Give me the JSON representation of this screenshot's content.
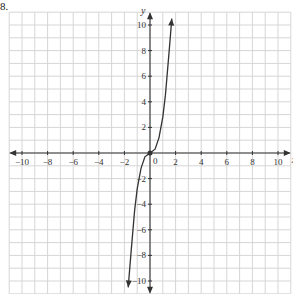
{
  "problem_number": "8.",
  "chart_data": {
    "type": "line",
    "title": "",
    "xlabel": "x",
    "ylabel": "y",
    "xlim": [
      -11,
      11
    ],
    "ylim": [
      -11,
      11
    ],
    "grid": true,
    "x_ticks": [
      -10,
      -8,
      -6,
      -4,
      -2,
      2,
      4,
      6,
      8,
      10
    ],
    "y_ticks": [
      -10,
      -8,
      -6,
      -4,
      -2,
      2,
      4,
      6,
      8,
      10
    ],
    "origin_label": "0",
    "series": [
      {
        "name": "curve",
        "x": [
          -1.7,
          -1.5,
          -1.2,
          -1.0,
          -0.7,
          -0.4,
          0,
          0.4,
          0.7,
          1.0,
          1.2,
          1.5,
          1.7
        ],
        "y": [
          -10.5,
          -8.0,
          -4.5,
          -2.8,
          -1.2,
          -0.3,
          0,
          0.3,
          1.2,
          2.8,
          4.5,
          8.0,
          10.5
        ],
        "arrows": "both ends"
      }
    ],
    "points": [
      {
        "x": 0,
        "y": 0
      }
    ]
  }
}
